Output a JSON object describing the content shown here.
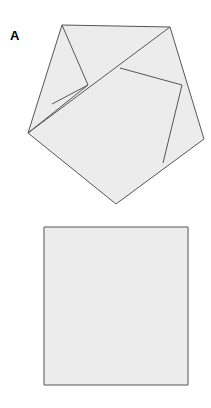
{
  "figure": {
    "width": 211,
    "height": 408,
    "background_color": "#ffffff",
    "fill_color": "#ececec",
    "stroke_color": "#555555",
    "label_color": "#000000",
    "stroke_width": 1
  },
  "panels": [
    {
      "id": "panel-a",
      "label": "A",
      "shape_name": "pentagon-with-internal-lines",
      "description": "Irregular pentagon subdivided by internal line segments",
      "outline_points": "62,25 170,27 204,139 116,204 28,133",
      "internal_segments": [
        {
          "name": "segment-topleft-to-center",
          "points": "62,25 88,85"
        },
        {
          "name": "segment-left-edge-to-center",
          "points": "52,104 88,85"
        },
        {
          "name": "segment-leftvertex-to-center",
          "points": "28,133 88,85"
        },
        {
          "name": "segment-long-diagonal",
          "points": "28,133 170,27"
        },
        {
          "name": "segment-center-to-right-edge",
          "points": "120,68 182,85"
        },
        {
          "name": "segment-right-edge-to-lower-right",
          "points": "182,85 163,163"
        }
      ]
    },
    {
      "id": "panel-b",
      "label": "B",
      "shape_name": "square",
      "description": "Plain filled square outline",
      "outline_points": "44,227 188,227 188,385 44,385"
    }
  ]
}
